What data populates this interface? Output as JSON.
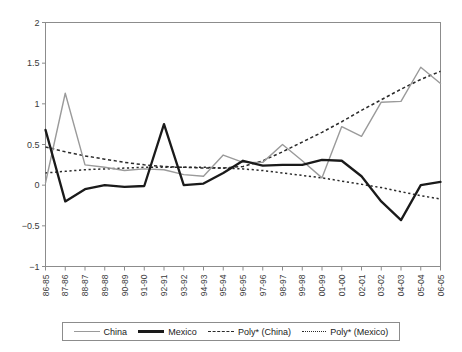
{
  "chart_data": {
    "type": "line",
    "title": "",
    "xlabel": "",
    "ylabel": "",
    "ylim": [
      -1,
      2
    ],
    "yticks": [
      "-1",
      "-0.5",
      "0",
      "0.5",
      "1",
      "1.5",
      "2"
    ],
    "ytick_values": [
      -1,
      -0.5,
      0,
      0.5,
      1,
      1.5,
      2
    ],
    "grid": false,
    "legend_position": "bottom",
    "categories": [
      "86-85",
      "87-86",
      "88-87",
      "89-88",
      "90-89",
      "91-90",
      "92-91",
      "93-92",
      "94-93",
      "95-94",
      "96-95",
      "97-96",
      "98-97",
      "99-98",
      "00-99",
      "01-00",
      "02-01",
      "03-02",
      "04-03",
      "05-04",
      "06-05"
    ],
    "series": [
      {
        "name": "China",
        "style": "solid",
        "color": "#9a9a9a",
        "values": [
          0.03,
          1.13,
          0.25,
          0.22,
          0.18,
          0.2,
          0.19,
          0.13,
          0.11,
          0.37,
          0.28,
          0.28,
          0.5,
          0.3,
          0.09,
          0.72,
          0.6,
          1.02,
          1.03,
          1.45,
          1.25
        ]
      },
      {
        "name": "Mexico",
        "style": "solid-bold",
        "color": "#1a1a1a",
        "values": [
          0.68,
          -0.2,
          -0.05,
          0.0,
          -0.02,
          -0.01,
          0.75,
          0.0,
          0.02,
          0.15,
          0.3,
          0.24,
          0.25,
          0.25,
          0.31,
          0.3,
          0.11,
          -0.2,
          -0.43,
          0.0,
          0.04
        ]
      },
      {
        "name": "Poly* (China)",
        "style": "dashed",
        "color": "#2a2a2a",
        "values": [
          0.47,
          0.41,
          0.36,
          0.32,
          0.28,
          0.25,
          0.23,
          0.22,
          0.21,
          0.21,
          0.23,
          0.3,
          0.41,
          0.53,
          0.65,
          0.78,
          0.92,
          1.05,
          1.18,
          1.3,
          1.4
        ]
      },
      {
        "name": "Poly* (Mexico)",
        "style": "dotted",
        "color": "#2a2a2a",
        "values": [
          0.15,
          0.17,
          0.19,
          0.2,
          0.21,
          0.22,
          0.22,
          0.22,
          0.22,
          0.21,
          0.2,
          0.18,
          0.15,
          0.12,
          0.09,
          0.05,
          0.01,
          -0.03,
          -0.08,
          -0.13,
          -0.17
        ]
      }
    ],
    "legend": [
      "China",
      "Mexico",
      "Poly* (China)",
      "Poly* (Mexico)"
    ]
  }
}
